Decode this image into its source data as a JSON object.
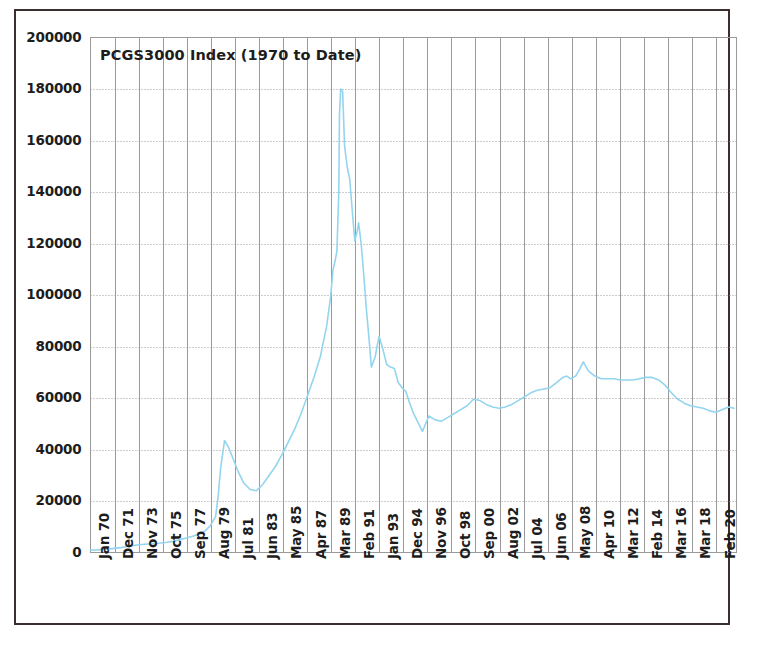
{
  "chart_data": {
    "type": "line",
    "title": "PCGS3000  Index  (1970 to Date)",
    "xlabel": "",
    "ylabel": "",
    "ylim": [
      0,
      200000
    ],
    "ytick_labels": [
      "200000",
      "180000",
      "160000",
      "140000",
      "120000",
      "100000",
      "80000",
      "60000",
      "40000",
      "20000",
      "0"
    ],
    "ytick_values": [
      200000,
      180000,
      160000,
      140000,
      120000,
      100000,
      80000,
      60000,
      40000,
      20000,
      0
    ],
    "grid": true,
    "grid_horizontal_style": "dotted",
    "grid_vertical_style": "solid",
    "legend": "none",
    "line_color": "#93d5ef",
    "grid_color": "#9a9a9a",
    "frame_color": "#3a2f2e",
    "background": "#ffffff",
    "categories": [
      "Jan 70",
      "Dec 71",
      "Nov 73",
      "Oct 75",
      "Sep 77",
      "Aug 79",
      "Jul 81",
      "Jun 83",
      "May 85",
      "Apr 87",
      "Mar 89",
      "Feb 91",
      "Jan 93",
      "Dec 94",
      "Nov 96",
      "Oct 98",
      "Sep 00",
      "Aug 02",
      "Jul 04",
      "Jun 06",
      "May 08",
      "Apr 10",
      "Mar 12",
      "Feb 14",
      "Mar 16",
      "Mar 18",
      "Feb 20"
    ],
    "series": [
      {
        "name": "PCGS3000 Index",
        "x": [
          1970.0,
          1970.5,
          1971.0,
          1971.5,
          1972.0,
          1972.5,
          1973.0,
          1973.5,
          1974.0,
          1974.5,
          1975.0,
          1975.5,
          1976.0,
          1976.5,
          1977.0,
          1977.5,
          1978.0,
          1978.5,
          1979.0,
          1979.4,
          1979.8,
          1980.0,
          1980.2,
          1980.5,
          1980.8,
          1981.2,
          1981.6,
          1982.0,
          1982.5,
          1983.0,
          1983.5,
          1984.0,
          1984.5,
          1985.0,
          1985.5,
          1986.0,
          1986.5,
          1987.0,
          1987.5,
          1988.0,
          1988.5,
          1988.8,
          1989.0,
          1989.15,
          1989.3,
          1989.45,
          1989.5,
          1989.6,
          1989.75,
          1989.9,
          1990.1,
          1990.3,
          1990.5,
          1990.7,
          1990.9,
          1991.0,
          1991.2,
          1991.4,
          1991.6,
          1991.8,
          1992.0,
          1992.3,
          1992.6,
          1992.9,
          1993.2,
          1993.5,
          1993.8,
          1994.1,
          1994.4,
          1994.7,
          1995.0,
          1995.3,
          1995.6,
          1996.0,
          1996.5,
          1997.0,
          1997.5,
          1998.0,
          1998.5,
          1999.0,
          1999.5,
          2000.0,
          2000.5,
          2001.0,
          2001.5,
          2002.0,
          2002.5,
          2003.0,
          2003.5,
          2004.0,
          2004.5,
          2005.0,
          2005.5,
          2006.0,
          2006.5,
          2007.0,
          2007.3,
          2007.6,
          2008.0,
          2008.3,
          2008.6,
          2009.0,
          2009.5,
          2010.0,
          2010.5,
          2011.0,
          2011.5,
          2012.0,
          2012.5,
          2013.0,
          2013.5,
          2014.0,
          2014.5,
          2015.0,
          2015.5,
          2016.0,
          2016.5,
          2017.0,
          2017.5,
          2018.0,
          2018.5,
          2019.0,
          2019.5,
          2020.0,
          2020.4
        ],
        "values": [
          900,
          1000,
          1200,
          1400,
          1700,
          2000,
          2400,
          2800,
          3100,
          3300,
          3500,
          3700,
          4000,
          4400,
          5000,
          5600,
          6300,
          7200,
          8500,
          10500,
          14000,
          22000,
          33000,
          43500,
          41000,
          36000,
          31000,
          27000,
          24500,
          24000,
          26500,
          30000,
          33500,
          38000,
          43000,
          48000,
          54000,
          61000,
          68000,
          76000,
          88000,
          99000,
          110000,
          113000,
          117000,
          140000,
          170000,
          180000,
          179000,
          158000,
          150000,
          145000,
          133000,
          121000,
          125000,
          128000,
          120000,
          108000,
          95000,
          84000,
          72000,
          76000,
          84000,
          79000,
          73000,
          72000,
          71500,
          66000,
          64000,
          62500,
          58000,
          54000,
          51000,
          47000,
          53000,
          51500,
          51000,
          52500,
          54000,
          55500,
          57000,
          59500,
          59000,
          57500,
          56500,
          56000,
          56500,
          57500,
          59000,
          60500,
          62000,
          63000,
          63500,
          64000,
          66000,
          68000,
          68500,
          67500,
          68500,
          71000,
          74000,
          70500,
          68500,
          67500,
          67500,
          67500,
          67000,
          67000,
          67000,
          67500,
          68000,
          68000,
          67000,
          65000,
          62000,
          59500,
          58000,
          57000,
          56500,
          56000,
          55000,
          54500,
          55500,
          56500,
          56000
        ]
      }
    ]
  },
  "axes": {
    "x_range": [
      1970.0,
      2020.6
    ]
  }
}
